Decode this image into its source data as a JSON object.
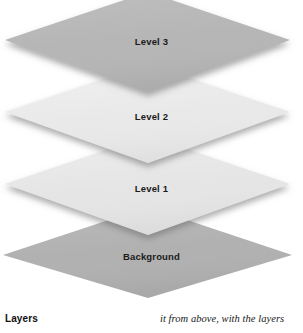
{
  "figure": {
    "title": "Layers",
    "type": "stacked-isometric-layers",
    "layers": [
      {
        "id": "level-3",
        "label": "Level 3",
        "fill": "#b6b6b6",
        "order": 3,
        "label_y": 37,
        "polygon": "5,40 148,-8 290,40 148,92",
        "shadow": true
      },
      {
        "id": "level-2",
        "label": "Level 2",
        "fill": "#e9e9e9",
        "order": 2,
        "label_y": 112,
        "polygon": "5,112 148,64 290,112 148,163",
        "shadow": true
      },
      {
        "id": "level-1",
        "label": "Level 1",
        "fill": "#e5e5e5",
        "order": 1,
        "label_y": 184,
        "polygon": "5,184 148,136 290,184 148,235",
        "shadow": true
      },
      {
        "id": "background",
        "label": "Background",
        "fill": "#b1b1b1",
        "order": 0,
        "label_y": 252,
        "polygon": "3,255 148,207 292,255 148,298",
        "shadow": false
      }
    ]
  },
  "caption": {
    "heading": "Layers",
    "body": "it from above, with the layers"
  },
  "colors": {
    "page_background": "#ffffff",
    "label_text": "#1b1b1b",
    "caption_text": "#111111",
    "shadow": "rgba(100,100,100,0.42)"
  }
}
